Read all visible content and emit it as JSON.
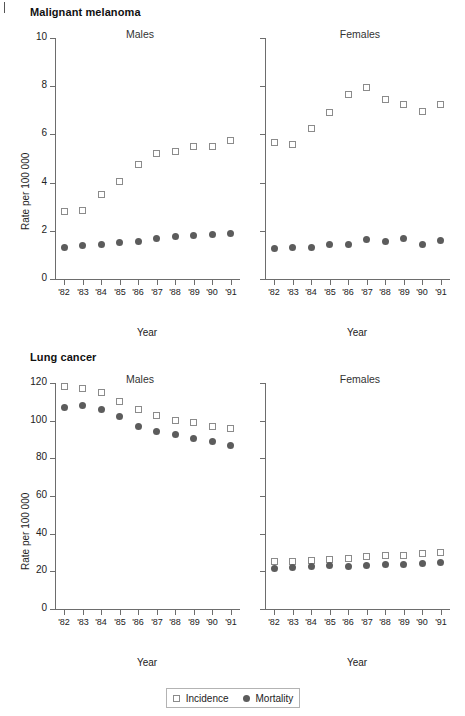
{
  "figure": {
    "ylabel": "Rate per 100 000",
    "xlabel": "Year",
    "sex_labels": {
      "males": "Males",
      "females": "Females"
    },
    "legend": {
      "incidence_label": "Incidence",
      "mortality_label": "Mortality",
      "incidence_icon": "open-square-marker",
      "mortality_icon": "filled-circle-marker"
    },
    "colors": {
      "axis": "#6d6d6d",
      "incidence_marker_edge": "#8b8b8b",
      "incidence_marker_fill": "#ffffff",
      "mortality_marker_fill": "#5c5c5c",
      "text": "#1a1a1a",
      "background": "#ffffff"
    }
  },
  "chart_data": [
    {
      "type": "scatter",
      "title": "Malignant melanoma",
      "panel": "Males",
      "xlabel": "Year",
      "ylabel": "Rate per 100 000",
      "categories": [
        "'82",
        "'83",
        "'84",
        "'85",
        "'86",
        "'87",
        "'88",
        "'89",
        "'90",
        "'91"
      ],
      "x": [
        1982,
        1983,
        1984,
        1985,
        1986,
        1987,
        1988,
        1989,
        1990,
        1991
      ],
      "ylim": [
        0,
        10
      ],
      "yticks": [
        0,
        2,
        4,
        6,
        8,
        10
      ],
      "grid": false,
      "legend_position": "bottom",
      "series": [
        {
          "name": "Incidence",
          "marker": "open-square",
          "values": [
            2.8,
            2.85,
            3.5,
            4.05,
            4.75,
            5.2,
            5.3,
            5.5,
            5.5,
            5.75
          ]
        },
        {
          "name": "Mortality",
          "marker": "filled-circle",
          "values": [
            1.3,
            1.4,
            1.45,
            1.5,
            1.55,
            1.7,
            1.75,
            1.8,
            1.85,
            1.9
          ]
        }
      ]
    },
    {
      "type": "scatter",
      "title": "Malignant melanoma",
      "panel": "Females",
      "xlabel": "Year",
      "ylabel": "Rate per 100 000",
      "categories": [
        "'82",
        "'83",
        "'84",
        "'85",
        "'86",
        "'87",
        "'88",
        "'89",
        "'90",
        "'91"
      ],
      "x": [
        1982,
        1983,
        1984,
        1985,
        1986,
        1987,
        1988,
        1989,
        1990,
        1991
      ],
      "ylim": [
        0,
        10
      ],
      "yticks": [
        0,
        2,
        4,
        6,
        8,
        10
      ],
      "grid": false,
      "legend_position": "bottom",
      "series": [
        {
          "name": "Incidence",
          "marker": "open-square",
          "values": [
            5.65,
            5.6,
            6.25,
            6.9,
            7.65,
            7.95,
            7.45,
            7.25,
            6.95,
            7.25
          ]
        },
        {
          "name": "Mortality",
          "marker": "filled-circle",
          "values": [
            1.25,
            1.3,
            1.3,
            1.45,
            1.45,
            1.65,
            1.55,
            1.7,
            1.45,
            1.6
          ]
        }
      ]
    },
    {
      "type": "scatter",
      "title": "Lung cancer",
      "panel": "Males",
      "xlabel": "Year",
      "ylabel": "Rate per 100 000",
      "categories": [
        "'82",
        "'83",
        "'84",
        "'85",
        "'86",
        "'87",
        "'88",
        "'89",
        "'90",
        "'91"
      ],
      "x": [
        1982,
        1983,
        1984,
        1985,
        1986,
        1987,
        1988,
        1989,
        1990,
        1991
      ],
      "ylim": [
        0,
        120
      ],
      "yticks": [
        0,
        20,
        40,
        60,
        80,
        100,
        120
      ],
      "grid": false,
      "legend_position": "bottom",
      "series": [
        {
          "name": "Incidence",
          "marker": "open-square",
          "values": [
            118,
            117,
            115,
            110,
            106,
            103,
            100,
            99,
            97,
            96
          ]
        },
        {
          "name": "Mortality",
          "marker": "filled-circle",
          "values": [
            107,
            108,
            106,
            102,
            97,
            94.5,
            92.5,
            90.5,
            89,
            87
          ]
        }
      ]
    },
    {
      "type": "scatter",
      "title": "Lung cancer",
      "panel": "Females",
      "xlabel": "Year",
      "ylabel": "Rate per 100 000",
      "categories": [
        "'82",
        "'83",
        "'84",
        "'85",
        "'86",
        "'87",
        "'88",
        "'89",
        "'90",
        "'91"
      ],
      "x": [
        1982,
        1983,
        1984,
        1985,
        1986,
        1987,
        1988,
        1989,
        1990,
        1991
      ],
      "ylim": [
        0,
        120
      ],
      "yticks": [
        0,
        20,
        40,
        60,
        80,
        100,
        120
      ],
      "grid": false,
      "legend_position": "bottom",
      "series": [
        {
          "name": "Incidence",
          "marker": "open-square",
          "values": [
            25,
            25,
            26,
            26.5,
            27,
            28,
            28.5,
            28.5,
            29.5,
            30
          ]
        },
        {
          "name": "Mortality",
          "marker": "filled-circle",
          "values": [
            21.5,
            22,
            22.5,
            23,
            22.5,
            23,
            23.5,
            23.5,
            24,
            24.5
          ]
        }
      ]
    }
  ]
}
